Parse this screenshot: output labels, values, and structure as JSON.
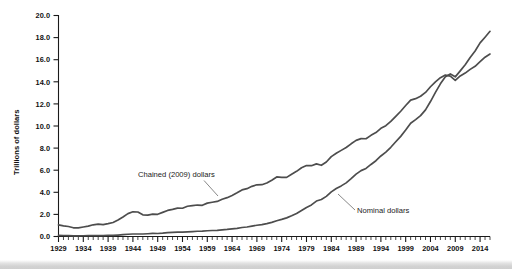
{
  "figure": {
    "background_color": "#ffffff",
    "line_color": "#4d4d4d",
    "axis_color": "#1a1a1a"
  },
  "axis": {
    "ylabel": "Trillions of dollars",
    "y_ticks": [
      "0.0",
      "2.0",
      "4.0",
      "6.0",
      "8.0",
      "10.0",
      "12.0",
      "14.0",
      "16.0",
      "18.0",
      "20.0"
    ],
    "x_ticks": [
      "1929",
      "1934",
      "1939",
      "1944",
      "1949",
      "1954",
      "1959",
      "1964",
      "1969",
      "1974",
      "1979",
      "1984",
      "1989",
      "1994",
      "1999",
      "2004",
      "2009",
      "2014"
    ]
  },
  "annotations": {
    "chained_label": "Chained (2009) dollars",
    "nominal_label": "Nominal dollars"
  },
  "chart_data": {
    "type": "line",
    "title": "",
    "xlabel": "",
    "ylabel": "Trillions of dollars",
    "xlim": [
      1929,
      2016
    ],
    "ylim": [
      0.0,
      20.0
    ],
    "grid": false,
    "legend": "inline annotations",
    "x": [
      1929,
      1930,
      1931,
      1932,
      1933,
      1934,
      1935,
      1936,
      1937,
      1938,
      1939,
      1940,
      1941,
      1942,
      1943,
      1944,
      1945,
      1946,
      1947,
      1948,
      1949,
      1950,
      1951,
      1952,
      1953,
      1954,
      1955,
      1956,
      1957,
      1958,
      1959,
      1960,
      1961,
      1962,
      1963,
      1964,
      1965,
      1966,
      1967,
      1968,
      1969,
      1970,
      1971,
      1972,
      1973,
      1974,
      1975,
      1976,
      1977,
      1978,
      1979,
      1980,
      1981,
      1982,
      1983,
      1984,
      1985,
      1986,
      1987,
      1988,
      1989,
      1990,
      1991,
      1992,
      1993,
      1994,
      1995,
      1996,
      1997,
      1998,
      1999,
      2000,
      2001,
      2002,
      2003,
      2004,
      2005,
      2006,
      2007,
      2008,
      2009,
      2010,
      2011,
      2012,
      2013,
      2014,
      2015,
      2016
    ],
    "series": [
      {
        "name": "Chained (2009) dollars",
        "values": [
          1.057,
          0.967,
          0.905,
          0.788,
          0.778,
          0.862,
          0.939,
          1.06,
          1.115,
          1.078,
          1.164,
          1.266,
          1.49,
          1.771,
          2.073,
          2.239,
          2.218,
          1.961,
          1.939,
          2.02,
          2.009,
          2.184,
          2.36,
          2.456,
          2.571,
          2.556,
          2.736,
          2.794,
          2.848,
          2.823,
          3.021,
          3.097,
          3.174,
          3.367,
          3.514,
          3.717,
          3.956,
          4.215,
          4.329,
          4.539,
          4.679,
          4.688,
          4.842,
          5.097,
          5.387,
          5.358,
          5.349,
          5.638,
          5.898,
          6.224,
          6.422,
          6.407,
          6.57,
          6.444,
          6.74,
          7.228,
          7.529,
          7.795,
          8.052,
          8.388,
          8.696,
          8.858,
          8.848,
          9.154,
          9.407,
          9.788,
          10.03,
          10.413,
          10.878,
          11.337,
          11.858,
          12.347,
          12.475,
          12.69,
          13.036,
          13.552,
          14.0,
          14.374,
          14.611,
          14.516,
          14.125,
          14.529,
          14.79,
          15.124,
          15.403,
          15.819,
          16.224,
          16.51
        ]
      },
      {
        "name": "Nominal dollars",
        "values": [
          0.105,
          0.092,
          0.077,
          0.059,
          0.057,
          0.066,
          0.074,
          0.085,
          0.092,
          0.087,
          0.093,
          0.102,
          0.129,
          0.166,
          0.203,
          0.224,
          0.228,
          0.228,
          0.25,
          0.275,
          0.273,
          0.3,
          0.347,
          0.367,
          0.389,
          0.391,
          0.426,
          0.45,
          0.474,
          0.482,
          0.522,
          0.543,
          0.563,
          0.605,
          0.638,
          0.685,
          0.742,
          0.813,
          0.86,
          0.94,
          1.018,
          1.073,
          1.165,
          1.279,
          1.425,
          1.545,
          1.685,
          1.873,
          2.082,
          2.352,
          2.627,
          2.857,
          3.207,
          3.344,
          3.634,
          4.038,
          4.339,
          4.58,
          4.855,
          5.236,
          5.642,
          5.963,
          6.158,
          6.52,
          6.859,
          7.287,
          7.64,
          8.073,
          8.578,
          9.063,
          9.631,
          10.252,
          10.582,
          10.936,
          11.458,
          12.214,
          13.037,
          13.815,
          14.452,
          14.713,
          14.449,
          14.992,
          15.543,
          16.197,
          16.785,
          17.522,
          18.037,
          18.569
        ]
      }
    ],
    "annotations": [
      {
        "text": "Chained (2009) dollars",
        "x": 1948,
        "y": 5.0
      },
      {
        "text": "Nominal dollars",
        "x": 1993,
        "y": 2.6
      }
    ]
  }
}
